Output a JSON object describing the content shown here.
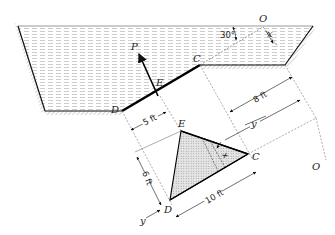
{
  "figure": {
    "points": {
      "D": "D",
      "E": "E",
      "C": "C",
      "O_top": "O",
      "O_right": "O",
      "P": "P"
    },
    "angle_label": "30°",
    "axis_labels": {
      "x_top": "x",
      "x_strip": "x",
      "y_mid": "y",
      "y_bottom": "y"
    },
    "dimensions": {
      "width_DE_offset": "5 ft",
      "height": "6 ft",
      "base": "10 ft",
      "depth_C": "8 ft"
    },
    "colors": {
      "water_lines": "#b8b8b8",
      "triangle_fill": "#d9d9d9",
      "line": "#111111"
    }
  }
}
